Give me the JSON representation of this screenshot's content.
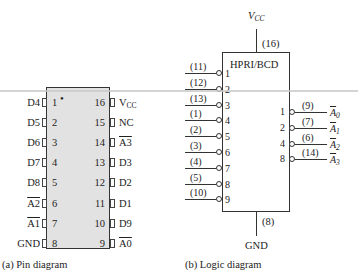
{
  "pin_diagram": {
    "caption": "(a)  Pin diagram",
    "left_pins": [
      {
        "num": "1",
        "label": "D4",
        "overline": false
      },
      {
        "num": "2",
        "label": "D5",
        "overline": false
      },
      {
        "num": "3",
        "label": "D6",
        "overline": false
      },
      {
        "num": "4",
        "label": "D7",
        "overline": false
      },
      {
        "num": "5",
        "label": "D8",
        "overline": false
      },
      {
        "num": "6",
        "label": "A2",
        "overline": true
      },
      {
        "num": "7",
        "label": "A1",
        "overline": true
      },
      {
        "num": "8",
        "label": "GND",
        "overline": false
      }
    ],
    "right_pins": [
      {
        "num": "16",
        "label": "V",
        "sub": "CC",
        "overline": false
      },
      {
        "num": "15",
        "label": "NC",
        "overline": false
      },
      {
        "num": "14",
        "label": "A3",
        "overline": true
      },
      {
        "num": "13",
        "label": "D3",
        "overline": false
      },
      {
        "num": "12",
        "label": "D2",
        "overline": false
      },
      {
        "num": "11",
        "label": "D1",
        "overline": false
      },
      {
        "num": "10",
        "label": "D9",
        "overline": false
      },
      {
        "num": "9",
        "label": "A0",
        "overline": true
      }
    ],
    "pin1_marker": "•"
  },
  "logic_diagram": {
    "caption": "(b)  Logic diagram",
    "title": "HPRI/BCD",
    "vcc_label": "V",
    "vcc_sub": "CC",
    "vcc_pin": "(16)",
    "gnd_label": "GND",
    "gnd_pin": "(8)",
    "inputs": [
      {
        "pin": "(11)",
        "index": "1"
      },
      {
        "pin": "(12)",
        "index": "2"
      },
      {
        "pin": "(13)",
        "index": "3"
      },
      {
        "pin": "(1)",
        "index": "4"
      },
      {
        "pin": "(2)",
        "index": "5"
      },
      {
        "pin": "(3)",
        "index": "6"
      },
      {
        "pin": "(4)",
        "index": "7"
      },
      {
        "pin": "(5)",
        "index": "8"
      },
      {
        "pin": "(10)",
        "index": "9"
      }
    ],
    "outputs": [
      {
        "weight": "1",
        "pin": "(9)",
        "label": "A",
        "sub": "0"
      },
      {
        "weight": "2",
        "pin": "(7)",
        "label": "A",
        "sub": "1"
      },
      {
        "weight": "4",
        "pin": "(6)",
        "label": "A",
        "sub": "2"
      },
      {
        "weight": "8",
        "pin": "(14)",
        "label": "A",
        "sub": "3"
      }
    ]
  }
}
